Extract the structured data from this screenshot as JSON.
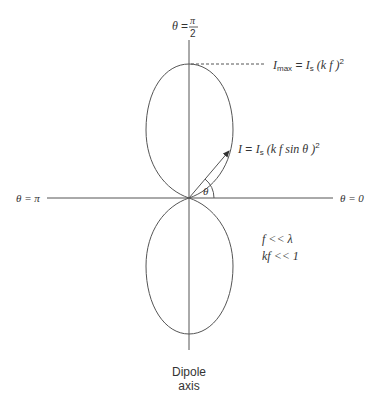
{
  "diagram": {
    "labels": {
      "theta_top": {
        "lhs": "θ",
        "eq": "=",
        "num": "π",
        "den": "2"
      },
      "theta_left": "θ = π",
      "theta_right": "θ = 0",
      "theta_angle": "θ",
      "imax": {
        "I": "I",
        "sub_max": "max",
        "eq": " = ",
        "Is": "I",
        "sub_s": "s",
        "rest": " (k f )",
        "sup": "2"
      },
      "intensity": {
        "I": "I",
        "eq": " = ",
        "Is": "I",
        "sub_s": "s",
        "rest": " (k f sin θ )",
        "sup": "2"
      },
      "cond1": "f << λ",
      "cond2": "kf << 1",
      "axis_label_line1": "Dipole",
      "axis_label_line2": "axis"
    },
    "geometry": {
      "origin": [
        189,
        198
      ],
      "lobe_height": 134,
      "lobe_half_width": 43,
      "arrow_end": [
        230,
        150
      ]
    }
  }
}
